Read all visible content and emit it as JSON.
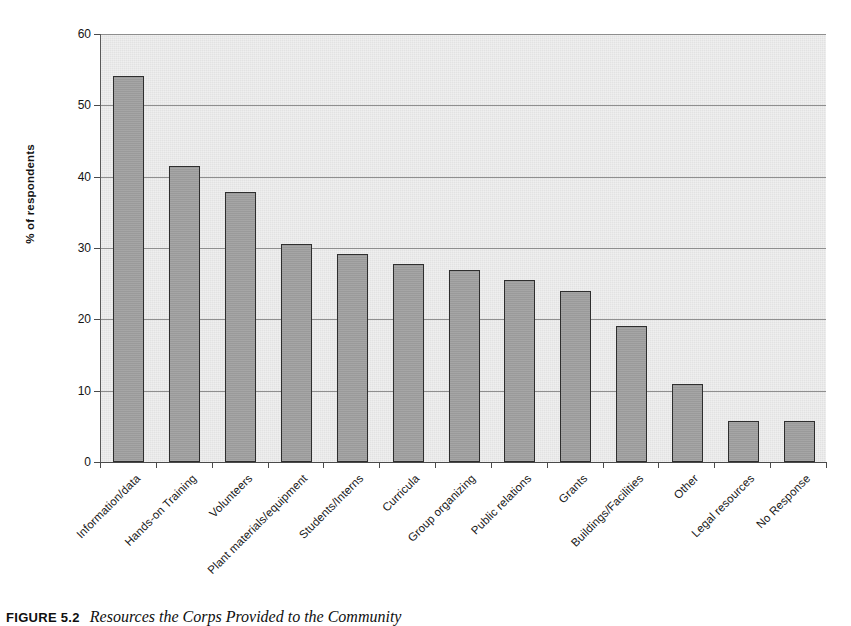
{
  "chart_data": {
    "type": "bar",
    "title": "",
    "xlabel": "",
    "ylabel": "% of respondents",
    "ylim": [
      0,
      60
    ],
    "ytick_values": [
      0,
      10,
      20,
      30,
      40,
      50,
      60
    ],
    "ytick_labels": [
      "0",
      "10",
      "20",
      "30",
      "40",
      "50",
      "60"
    ],
    "grid": true,
    "legend": "none",
    "categories": [
      "Information/data",
      "Hands-on Training",
      "Volunteers",
      "Plant materials/equipment",
      "Students/Interns",
      "Curricula",
      "Group organizing",
      "Public relations",
      "Grants",
      "Buildings/Facilities",
      "Other",
      "Legal resources",
      "No Response"
    ],
    "values": [
      54.1,
      41.5,
      37.9,
      30.5,
      29.1,
      27.7,
      26.9,
      25.5,
      24.0,
      19.0,
      10.9,
      5.8,
      5.8
    ],
    "bar_color": "#9d9d9d",
    "bar_edge_color": "#2e2e2e",
    "plot_background": "#e9e9e9",
    "gridline_color": "#8e8e8e"
  },
  "caption": {
    "figure_number": "FIGURE 5.2",
    "text": "Resources the Corps Provided to the Community"
  }
}
